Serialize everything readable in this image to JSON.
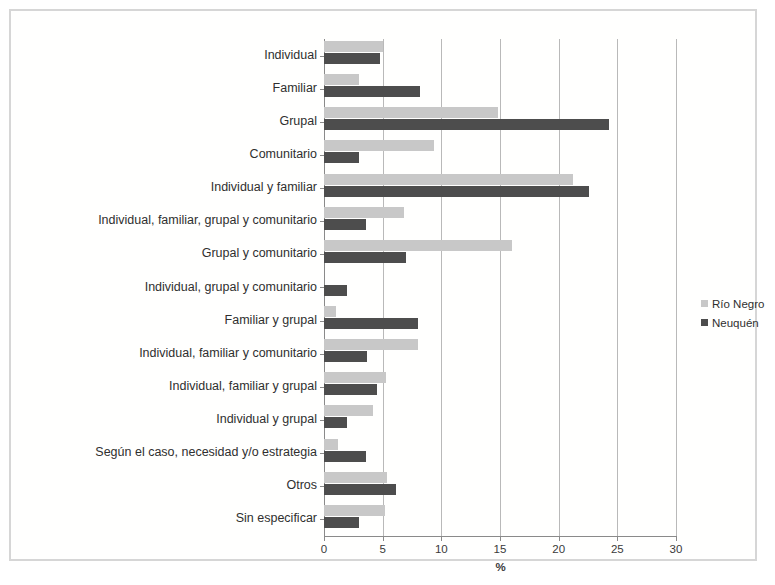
{
  "chart_data": {
    "type": "bar",
    "orientation": "horizontal",
    "title": "",
    "xlabel": "%",
    "ylabel": "",
    "xlim": [
      0,
      30
    ],
    "xticks": [
      0,
      5,
      10,
      15,
      20,
      25,
      30
    ],
    "grid": true,
    "legend_position": "right",
    "categories": [
      "Individual",
      "Familiar",
      "Grupal",
      "Comunitario",
      "Individual y familiar",
      "Individual, familiar, grupal y comunitario",
      "Grupal y comunitario",
      "Individual, grupal y comunitario",
      "Familiar y grupal",
      "Individual, familiar y comunitario",
      "Individual, familiar y grupal",
      "Individual y grupal",
      "Según el caso, necesidad y/o estrategia",
      "Otros",
      "Sin especificar"
    ],
    "series": [
      {
        "name": "Río Negro",
        "color": "#c8c8c8",
        "values": [
          5.0,
          3.0,
          14.8,
          9.4,
          21.2,
          6.8,
          16.0,
          0.0,
          1.0,
          8.0,
          5.3,
          4.2,
          1.2,
          5.4,
          5.2
        ]
      },
      {
        "name": "Neuquén",
        "color": "#4d4d4d",
        "values": [
          4.8,
          8.2,
          24.3,
          3.0,
          22.6,
          3.6,
          7.0,
          2.0,
          8.0,
          3.7,
          4.5,
          2.0,
          3.6,
          6.1,
          3.0
        ]
      }
    ]
  },
  "axis": {
    "x_title": "%",
    "tick_labels": [
      "0",
      "5",
      "10",
      "15",
      "20",
      "25",
      "30"
    ]
  },
  "legend": {
    "items": [
      {
        "label": "Río Negro",
        "color": "#c8c8c8"
      },
      {
        "label": "Neuquén",
        "color": "#4d4d4d"
      }
    ]
  }
}
